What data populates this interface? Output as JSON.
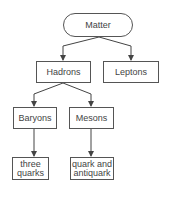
{
  "diagram": {
    "type": "tree",
    "nodes": {
      "matter": {
        "label": "Matter",
        "shape": "rounded"
      },
      "hadrons": {
        "label": "Hadrons",
        "shape": "rect"
      },
      "leptons": {
        "label": "Leptons",
        "shape": "rect"
      },
      "baryons": {
        "label": "Baryons",
        "shape": "rect"
      },
      "mesons": {
        "label": "Mesons",
        "shape": "rect"
      },
      "three_quarks": {
        "label": "three quarks",
        "shape": "rect"
      },
      "quark_antiquark": {
        "label": "quark and antiquark",
        "shape": "rect"
      }
    },
    "edges": [
      {
        "from": "Matter",
        "to": "Hadrons"
      },
      {
        "from": "Matter",
        "to": "Leptons"
      },
      {
        "from": "Hadrons",
        "to": "Baryons"
      },
      {
        "from": "Hadrons",
        "to": "Mesons"
      },
      {
        "from": "Baryons",
        "to": "three quarks"
      },
      {
        "from": "Mesons",
        "to": "quark and antiquark"
      }
    ],
    "colors": {
      "line": "#444444",
      "border": "#555555",
      "text": "#444444",
      "background": "#ffffff"
    }
  }
}
